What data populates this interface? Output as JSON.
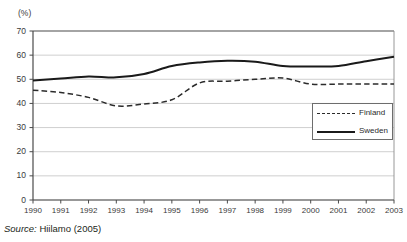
{
  "axis_unit_label": "(%)",
  "source": {
    "prefix": "Source:",
    "reference": "Hiilamo (2005)"
  },
  "legend": {
    "position": "inside-right-middle",
    "entries": [
      {
        "label": "Finland",
        "style": "dashed",
        "color": "#2b2b2b"
      },
      {
        "label": "Sweden",
        "style": "solid",
        "color": "#1a1a1a"
      }
    ]
  },
  "chart_data": {
    "type": "line",
    "title": "",
    "subtitle": "",
    "xlabel": "",
    "ylabel": "(%)",
    "ylim": [
      0,
      70
    ],
    "ytick_step": 10,
    "yticks": [
      0,
      10,
      20,
      30,
      40,
      50,
      60,
      70
    ],
    "ytick_labels": [
      "0",
      "10",
      "20",
      "30",
      "40",
      "50",
      "60",
      "70"
    ],
    "grid": true,
    "grid_axis": "y",
    "x": [
      1990,
      1991,
      1992,
      1993,
      1994,
      1995,
      1996,
      1997,
      1998,
      1999,
      2000,
      2001,
      2002,
      2003
    ],
    "categories": [
      "1990",
      "1991",
      "1992",
      "1993",
      "1994",
      "1995",
      "1996",
      "1997",
      "1998",
      "1999",
      "2000",
      "2001",
      "2002",
      "2003"
    ],
    "legend_position": "inside right",
    "series": [
      {
        "name": "Finland",
        "style": "dashed",
        "color": "#2b2b2b",
        "values": [
          45.5,
          44.5,
          42.5,
          39.0,
          39.8,
          41.5,
          48.5,
          49.2,
          50.0,
          50.5,
          48.0,
          48.0,
          48.0,
          48.0
        ]
      },
      {
        "name": "Sweden",
        "style": "solid",
        "color": "#1a1a1a",
        "values": [
          49.5,
          50.3,
          51.2,
          50.8,
          52.2,
          55.5,
          57.0,
          57.7,
          57.3,
          55.5,
          55.3,
          55.5,
          57.5,
          59.3
        ]
      }
    ],
    "annotations": []
  },
  "plot_geometry": {
    "left": 33,
    "right": 394,
    "top": 31,
    "bottom": 200
  }
}
